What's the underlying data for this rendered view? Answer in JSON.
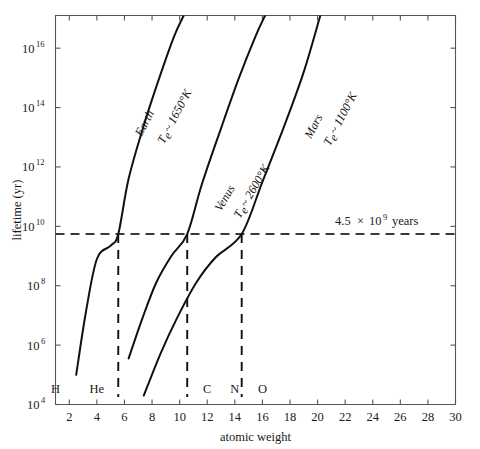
{
  "chart_data": {
    "type": "line",
    "title": "",
    "xlabel": "atomic weight",
    "ylabel": "lifetime (yr)",
    "xlim": [
      1,
      30
    ],
    "ylim": [
      4,
      17.1
    ],
    "y_scale": "log10",
    "grid": false,
    "legend_position": "inline-curve-labels",
    "xticks": [
      2,
      4,
      6,
      8,
      10,
      12,
      14,
      16,
      18,
      20,
      22,
      24,
      26,
      28,
      30
    ],
    "xtick_labels": [
      "2",
      "4",
      "6",
      "8",
      "10",
      "12",
      "14",
      "16",
      "18",
      "20",
      "22",
      "24",
      "26",
      "28",
      "30"
    ],
    "yticks_exponent": [
      4,
      6,
      8,
      10,
      12,
      14,
      16
    ],
    "ytick_labels": [
      "10⁴",
      "10⁶",
      "10⁸",
      "10¹⁰",
      "10¹²",
      "10¹⁴",
      "10¹⁶"
    ],
    "ytick_mantissa": "10",
    "ytick_exponents": [
      "4",
      "6",
      "8",
      "10",
      "12",
      "14",
      "16"
    ],
    "element_markers": [
      {
        "label": "H",
        "atomic_weight": 1
      },
      {
        "label": "He",
        "atomic_weight": 4
      },
      {
        "label": "C",
        "atomic_weight": 12
      },
      {
        "label": "N",
        "atomic_weight": 14
      },
      {
        "label": "O",
        "atomic_weight": 16
      }
    ],
    "annotations": [
      {
        "name": "age-of-solar-system",
        "text_value": "4.5",
        "text_times": "×",
        "text_base": "10",
        "text_exponent": "9",
        "text_unit": "years",
        "full_text": "4.5 × 10⁹ years",
        "y_value_log10": 9.74,
        "line_style": "dashed-horizontal"
      }
    ],
    "series": [
      {
        "name": "Earth",
        "label_body": "Earth",
        "label_temp_symbol": "T",
        "label_temp_subscript": "e",
        "label_temp_value": "~ 1650°K",
        "label_temp_full": "Tₑ ~ 1650°K",
        "temperature_K": 1650,
        "points": [
          {
            "x": 2.5,
            "y_log10": 5.0
          },
          {
            "x": 3.2,
            "y_log10": 7.1
          },
          {
            "x": 4.0,
            "y_log10": 8.9
          },
          {
            "x": 5.0,
            "y_log10": 9.35
          },
          {
            "x": 5.55,
            "y_log10": 9.74
          },
          {
            "x": 6.3,
            "y_log10": 11.6
          },
          {
            "x": 7.4,
            "y_log10": 13.4
          },
          {
            "x": 8.6,
            "y_log10": 15.1
          },
          {
            "x": 9.6,
            "y_log10": 16.4
          },
          {
            "x": 10.3,
            "y_log10": 17.1
          }
        ],
        "crossing_x": 5.55
      },
      {
        "name": "Venus",
        "label_body": "Venus",
        "label_temp_symbol": "T",
        "label_temp_subscript": "e",
        "label_temp_value": "~ 2600°K",
        "label_temp_full": "Tₑ ~ 2600°K",
        "temperature_K": 2600,
        "points": [
          {
            "x": 6.3,
            "y_log10": 5.55
          },
          {
            "x": 7.3,
            "y_log10": 6.9
          },
          {
            "x": 8.3,
            "y_log10": 8.1
          },
          {
            "x": 9.4,
            "y_log10": 9.0
          },
          {
            "x": 10.55,
            "y_log10": 9.74
          },
          {
            "x": 11.6,
            "y_log10": 11.4
          },
          {
            "x": 13.0,
            "y_log10": 13.3
          },
          {
            "x": 14.3,
            "y_log10": 15.0
          },
          {
            "x": 15.5,
            "y_log10": 16.4
          },
          {
            "x": 16.2,
            "y_log10": 17.1
          }
        ],
        "crossing_x": 10.55
      },
      {
        "name": "Mars",
        "label_body": "Mars",
        "label_temp_symbol": "T",
        "label_temp_subscript": "e",
        "label_temp_value": "~ 1100°K",
        "label_temp_full": "Tₑ ~ 1100°K",
        "temperature_K": 1100,
        "points": [
          {
            "x": 7.4,
            "y_log10": 4.3
          },
          {
            "x": 8.6,
            "y_log10": 5.7
          },
          {
            "x": 9.8,
            "y_log10": 6.9
          },
          {
            "x": 11.2,
            "y_log10": 8.1
          },
          {
            "x": 12.6,
            "y_log10": 8.95
          },
          {
            "x": 14.5,
            "y_log10": 9.74
          },
          {
            "x": 16.0,
            "y_log10": 11.5
          },
          {
            "x": 17.6,
            "y_log10": 13.4
          },
          {
            "x": 19.0,
            "y_log10": 15.2
          },
          {
            "x": 20.2,
            "y_log10": 17.1
          }
        ],
        "crossing_x": 14.5
      }
    ],
    "drop_lines": [
      {
        "series": "Earth",
        "x": 5.55,
        "from_y_log10": 9.74,
        "to_y_log10": 4.25
      },
      {
        "series": "Venus",
        "x": 10.55,
        "from_y_log10": 9.74,
        "to_y_log10": 4.25
      },
      {
        "series": "Mars",
        "x": 14.5,
        "from_y_log10": 9.74,
        "to_y_log10": 4.25
      }
    ],
    "colors": {
      "curve": "#111111",
      "axis": "#555555",
      "dashed": "#222222",
      "background": "#ffffff"
    }
  }
}
